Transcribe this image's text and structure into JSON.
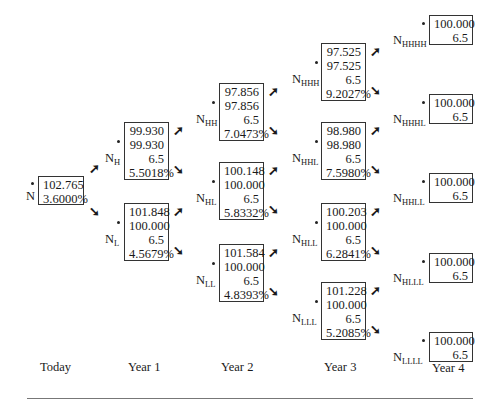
{
  "title": "Binomial interest rate tree for bond valuation",
  "years": [
    "Today",
    "Year 1",
    "Year 2",
    "Year 3",
    "Year 4"
  ],
  "nodes": {
    "N": {
      "label": "N",
      "sub": "",
      "value": "102.765",
      "rate": "3.6000%"
    },
    "NH": {
      "label": "N",
      "sub": "H",
      "value": "99.930",
      "clean": "99.930",
      "coupon": "6.5",
      "rate": "5.5018%"
    },
    "NL": {
      "label": "N",
      "sub": "L",
      "value": "101.848",
      "clean": "100.000",
      "coupon": "6.5",
      "rate": "4.5679%"
    },
    "NHH": {
      "label": "N",
      "sub": "HH",
      "value": "97.856",
      "clean": "97.856",
      "coupon": "6.5",
      "rate": "7.0473%"
    },
    "NHL": {
      "label": "N",
      "sub": "HL",
      "value": "100.148",
      "clean": "100.000",
      "coupon": "6.5",
      "rate": "5.8332%"
    },
    "NLL": {
      "label": "N",
      "sub": "LL",
      "value": "101.584",
      "clean": "100.000",
      "coupon": "6.5",
      "rate": "4.8393%"
    },
    "NHHH": {
      "label": "N",
      "sub": "HHH",
      "value": "97.525",
      "clean": "97.525",
      "coupon": "6.5",
      "rate": "9.2027%"
    },
    "NHHL": {
      "label": "N",
      "sub": "HHL",
      "value": "98.980",
      "clean": "98.980",
      "coupon": "6.5",
      "rate": "7.5980%"
    },
    "NHLL": {
      "label": "N",
      "sub": "HLL",
      "value": "100.203",
      "clean": "100.000",
      "coupon": "6.5",
      "rate": "6.2841%"
    },
    "NLLL": {
      "label": "N",
      "sub": "LLL",
      "value": "101.228",
      "clean": "100.000",
      "coupon": "6.5",
      "rate": "5.2085%"
    },
    "NHHHH": {
      "label": "N",
      "sub": "HHHH",
      "value": "100.000",
      "coupon": "6.5"
    },
    "NHHHL": {
      "label": "N",
      "sub": "HHHL",
      "value": "100.000",
      "coupon": "6.5"
    },
    "NHHLL": {
      "label": "N",
      "sub": "HHLL",
      "value": "100.000",
      "coupon": "6.5"
    },
    "NHLLL": {
      "label": "N",
      "sub": "HLLL",
      "value": "100.000",
      "coupon": "6.5"
    },
    "NLLLL": {
      "label": "N",
      "sub": "LLLL",
      "value": "100.000",
      "coupon": "6.5"
    }
  },
  "arrows": {
    "up": "➚",
    "down": "➘"
  }
}
